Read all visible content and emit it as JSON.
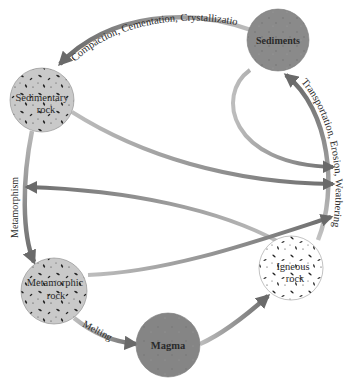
{
  "nodes": {
    "sediments": {
      "label": "Sediments",
      "fill": "#8a8a8a"
    },
    "sedimentary": {
      "line1": "Sedimentary",
      "line2": "rock",
      "fill": "#c9c9c9"
    },
    "metamorphic": {
      "line1": "Metamorphic",
      "line2": "rock",
      "fill": "#c9c9c9"
    },
    "magma": {
      "label": "Magma",
      "fill": "#858585"
    },
    "igneous": {
      "line1": "Igneous",
      "line2": "rock",
      "fill": "#ffffff"
    }
  },
  "processes": {
    "compaction": "Compaction, Cementation, Crystallizatio",
    "transport": "Transportation, Erosion, Weathering",
    "metamorphism": "Metamorphism",
    "melting": "Melting"
  },
  "colors": {
    "arrow_dark": "#6e6e6e",
    "arrow_light": "#b4b4b4",
    "text": "#2a2a2a"
  }
}
